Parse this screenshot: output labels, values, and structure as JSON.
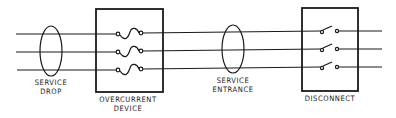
{
  "diagram": {
    "colors": {
      "ink": "#1a1a1a",
      "background": "#ffffff"
    },
    "conductors": 3,
    "labels": {
      "service_drop": [
        "SERVICE",
        "DROP"
      ],
      "overcurrent_device": [
        "OVERCURRENT",
        "DEVICE"
      ],
      "service_entrance": [
        "SERVICE",
        "ENTRANCE"
      ],
      "disconnect": [
        "DISCONNECT"
      ]
    }
  }
}
